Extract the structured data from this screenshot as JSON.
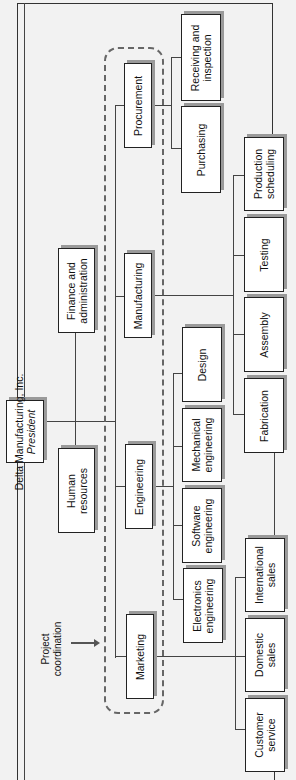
{
  "chart": {
    "orientation": "rotated-90-ccw",
    "root": {
      "name": "Delta Manufacturing, Inc.",
      "title": "President"
    },
    "staff": [
      {
        "name": "Finance and administration"
      },
      {
        "name": "Human resources"
      }
    ],
    "departments": [
      {
        "name": "Procurement",
        "units": [
          "Receiving and inspection",
          "Purchasing"
        ]
      },
      {
        "name": "Manufacturing",
        "units": [
          "Production scheduling",
          "Testing",
          "Assembly",
          "Fabrication"
        ]
      },
      {
        "name": "Engineering",
        "units": [
          "Design",
          "Mechanical engineering",
          "Software engineering",
          "Electronics engineering"
        ]
      },
      {
        "name": "Marketing",
        "units": [
          "International sales",
          "Domestic sales",
          "Customer service"
        ]
      }
    ],
    "annotation": {
      "label": "Project coordination",
      "style": "dashed rounded box around departments"
    }
  },
  "labels": {
    "president_name": "Delta Manufacturing, Inc.",
    "president_title": "President",
    "finance_l1": "Finance and",
    "finance_l2": "administration",
    "hr_l1": "Human",
    "hr_l2": "resources",
    "procurement": "Procurement",
    "manufacturing": "Manufacturing",
    "engineering": "Engineering",
    "marketing": "Marketing",
    "receiving_l1": "Receiving and",
    "receiving_l2": "inspection",
    "purchasing": "Purchasing",
    "prodsched_l1": "Production",
    "prodsched_l2": "scheduling",
    "testing": "Testing",
    "assembly": "Assembly",
    "fabrication": "Fabrication",
    "design": "Design",
    "mecheng_l1": "Mechanical",
    "mecheng_l2": "engineering",
    "softeng_l1": "Software",
    "softeng_l2": "engineering",
    "eleceng_l1": "Electronics",
    "eleceng_l2": "engineering",
    "intlsales_l1": "International",
    "intlsales_l2": "sales",
    "domsales_l1": "Domestic",
    "domsales_l2": "sales",
    "custsvc_l1": "Customer",
    "custsvc_l2": "service",
    "projcoord_l1": "Project",
    "projcoord_l2": "coordination"
  },
  "colors": {
    "background": "#f2f2f2",
    "box": "#ffffff",
    "border": "#222222",
    "shadow": "#9a9a9a",
    "dash": "#666666"
  }
}
